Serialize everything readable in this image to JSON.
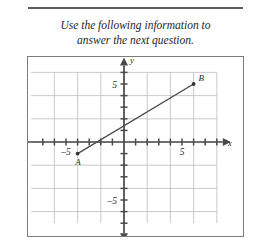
{
  "header": {
    "rule": "horizontal-rule",
    "prompt_line1": "Use the following information to",
    "prompt_line2": "answer the next question."
  },
  "graph": {
    "x_axis_label": "x",
    "y_axis_label": "y",
    "x_tick_labels": [
      {
        "value": -5,
        "text": "–5"
      },
      {
        "value": 5,
        "text": "5"
      }
    ],
    "y_tick_labels": [
      {
        "value": 5,
        "text": "5"
      },
      {
        "value": -5,
        "text": "–5"
      }
    ],
    "points": [
      {
        "name": "A",
        "label": "A",
        "x": -4,
        "y": -1
      },
      {
        "name": "B",
        "label": "B",
        "x": 6,
        "y": 5
      }
    ],
    "segment": {
      "from": "A",
      "to": "B"
    },
    "colors": {
      "grid": "#b9bcc4",
      "axis": "#4a4a4a",
      "segment": "#4a4a4a",
      "point": "#333333",
      "border": "#7d7d7d"
    }
  },
  "chart_data": {
    "type": "scatter",
    "title": "",
    "xlabel": "x",
    "ylabel": "y",
    "xlim": [
      -8,
      8
    ],
    "ylim": [
      -7,
      6
    ],
    "grid": true,
    "grid_spacing": 2,
    "tick_spacing": 1,
    "legend": "none",
    "series": [
      {
        "name": "segment AB",
        "points": [
          {
            "label": "A",
            "x": -4,
            "y": -1
          },
          {
            "label": "B",
            "x": 6,
            "y": 5
          }
        ],
        "line": true
      }
    ],
    "annotations": [
      "A",
      "B"
    ]
  }
}
